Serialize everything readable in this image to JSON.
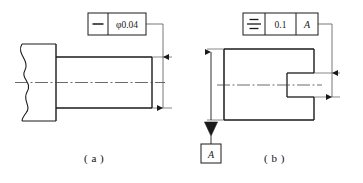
{
  "figure": {
    "background_color": "#ffffff",
    "line_color": "#1a1a1a",
    "thin_line_color": "#555555",
    "centerline_color": "#444444"
  },
  "panel_a": {
    "caption": "( a )",
    "feature_control_frame": {
      "symbol_name": "straightness-symbol",
      "symbol_glyph": "—",
      "tolerance_value": "φ0.04",
      "cells": [
        "—",
        "φ0.04"
      ]
    },
    "part": {
      "shape_name": "stepped-shaft-with-break",
      "has_break_line": true,
      "has_centerline": true
    }
  },
  "panel_b": {
    "caption": "( b )",
    "feature_control_frame": {
      "symbol_name": "symmetry-symbol",
      "symbol_glyph": "≡",
      "tolerance_value": "0.1",
      "datum_reference": "A",
      "cells": [
        "≡",
        "0.1",
        "A"
      ]
    },
    "datum_feature": {
      "label": "A",
      "name": "datum-a-label",
      "triangle_filled": true
    },
    "part": {
      "shape_name": "block-with-slot",
      "has_centerline": true
    }
  }
}
